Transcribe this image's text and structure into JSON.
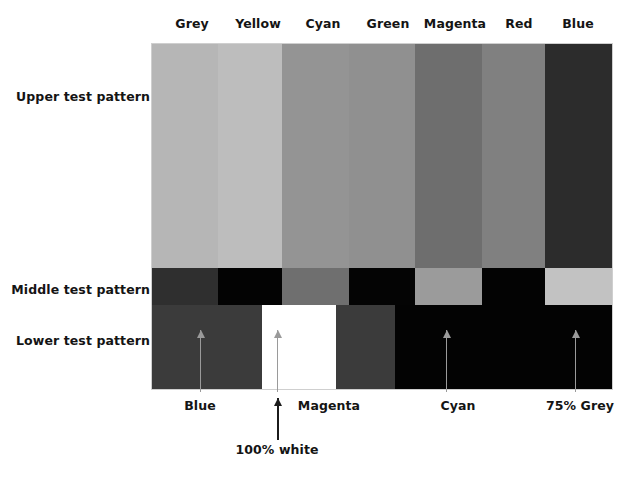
{
  "figure": {
    "row_labels": [
      {
        "text": "Upper test pattern",
        "y": 96
      },
      {
        "text": "Middle test pattern",
        "y": 289
      },
      {
        "text": "Lower test pattern",
        "y": 340
      }
    ],
    "column_headers": [
      {
        "label": "Grey",
        "x": 192
      },
      {
        "label": "Yellow",
        "x": 258
      },
      {
        "label": "Cyan",
        "x": 323
      },
      {
        "label": "Green",
        "x": 388
      },
      {
        "label": "Magenta",
        "x": 455
      },
      {
        "label": "Red",
        "x": 519
      },
      {
        "label": "Blue",
        "x": 578
      }
    ],
    "callouts": [
      {
        "label": "Blue",
        "x": 200,
        "arrow_x": 200,
        "arrow_top": 330,
        "arrow_height": 62,
        "style": "grey"
      },
      {
        "label": "100% white",
        "x": 277,
        "arrow_x": 277,
        "arrow_top": 398,
        "arrow_height": 42,
        "style": "dark"
      },
      {
        "label": "Magenta",
        "x": 329,
        "arrow_x": 277,
        "arrow_top": 330,
        "arrow_height": 62,
        "style": "grey"
      },
      {
        "label": "Cyan",
        "x": 458,
        "arrow_x": 446,
        "arrow_top": 330,
        "arrow_height": 62,
        "style": "grey"
      },
      {
        "label": "75% Grey",
        "x": 580,
        "arrow_x": 575,
        "arrow_top": 330,
        "arrow_height": 62,
        "style": "grey"
      }
    ],
    "callout_label_y": 404,
    "white_callout_label_y": 448
  },
  "chart_data": {
    "type": "bar",
    "xlabel": "",
    "ylabel": "",
    "categories": [
      "Grey",
      "Yellow",
      "Cyan",
      "Green",
      "Magenta",
      "Red",
      "Blue"
    ],
    "series": [
      {
        "name": "Upper test pattern",
        "values": [
          "#b6b6b6",
          "#bdbdbd",
          "#949494",
          "#909090",
          "#6e6e6e",
          "#808080",
          "#2c2c2c"
        ],
        "widths": [
          66,
          64,
          67,
          66,
          67,
          63,
          67
        ]
      },
      {
        "name": "Middle test pattern",
        "values": [
          "#2f2f2f",
          "#030303",
          "#6f6f6f",
          "#040404",
          "#9b9b9b",
          "#030303",
          "#c2c2c2"
        ],
        "widths": [
          66,
          64,
          67,
          66,
          67,
          63,
          67
        ]
      },
      {
        "name": "Lower test pattern",
        "values": [
          "#3b3b3b",
          "#ffffff",
          "#3b3b3b",
          "#030303",
          "#030303",
          "#030303",
          "#030303"
        ],
        "widths": [
          110,
          74,
          59,
          217,
          0,
          0,
          0
        ]
      }
    ],
    "grid": false,
    "legend": "none",
    "annotations": [
      "Blue",
      "100% white",
      "Magenta",
      "Cyan",
      "75% Grey"
    ]
  }
}
